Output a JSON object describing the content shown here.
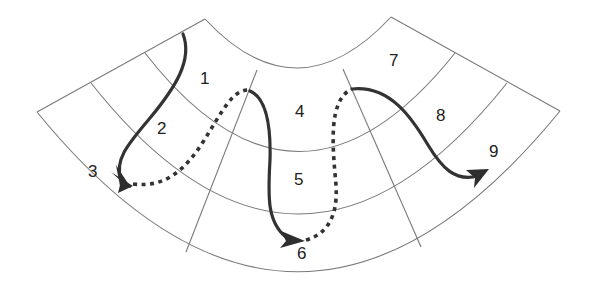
{
  "diagram": {
    "type": "fan-shaped grid with traversal path",
    "colors": {
      "grid": "#7a7a7a",
      "path": "#333333",
      "background": "#ffffff"
    },
    "cells": [
      {
        "id": "1",
        "label": "1"
      },
      {
        "id": "2",
        "label": "2"
      },
      {
        "id": "3",
        "label": "3"
      },
      {
        "id": "4",
        "label": "4"
      },
      {
        "id": "5",
        "label": "5"
      },
      {
        "id": "6",
        "label": "6"
      },
      {
        "id": "7",
        "label": "7"
      },
      {
        "id": "8",
        "label": "8"
      },
      {
        "id": "9",
        "label": "9"
      }
    ],
    "path_segments": [
      {
        "from": "1",
        "to": "3",
        "style": "solid",
        "arrow": true
      },
      {
        "from": "3",
        "to": "4",
        "style": "dotted",
        "arrow": false
      },
      {
        "from": "4",
        "to": "6",
        "style": "solid",
        "arrow": true
      },
      {
        "from": "6",
        "to": "7",
        "style": "dotted",
        "arrow": false
      },
      {
        "from": "7",
        "to": "9",
        "style": "solid",
        "arrow": true
      }
    ]
  }
}
